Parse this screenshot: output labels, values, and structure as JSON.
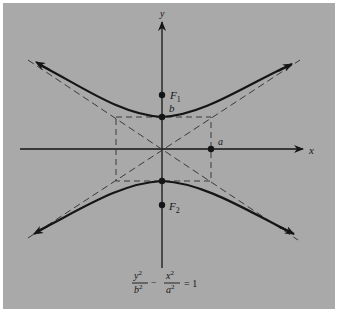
{
  "diagram": {
    "type": "hyperbola",
    "orientation": "vertical-transverse-axis",
    "labels": {
      "x_axis": "x",
      "y_axis": "y",
      "focus_top": "F",
      "focus_top_sub": "1",
      "focus_bottom": "F",
      "focus_bottom_sub": "2",
      "vertex": "b",
      "semi_axis_point": "a"
    },
    "equation": {
      "term1_num": "y",
      "term1_num_exp": "2",
      "term1_den": "b",
      "term1_den_exp": "2",
      "minus": "−",
      "term2_num": "x",
      "term2_num_exp": "2",
      "term2_den": "a",
      "term2_den_exp": "2",
      "equals": "= 1"
    },
    "colors": {
      "background": "#a9a9a9",
      "ink": "#151515",
      "border": "#ffffff"
    }
  }
}
